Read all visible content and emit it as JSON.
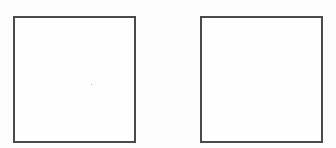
{
  "diagram": {
    "boxes": [
      {
        "id": "left",
        "label": "",
        "x": 13,
        "y": 16,
        "width": 123,
        "height": 127
      },
      {
        "id": "right",
        "label": "",
        "x": 200,
        "y": 16,
        "width": 123,
        "height": 127
      }
    ],
    "colors": {
      "border": "#4a4a4a",
      "background": "#fdfdfd"
    }
  }
}
